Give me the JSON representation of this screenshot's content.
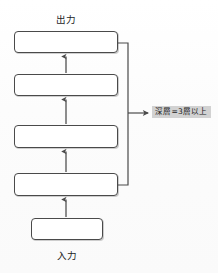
{
  "diagram": {
    "type": "neural-network-layer-stack",
    "background_color": "#fdfdfd",
    "stroke_color": "#4a4a4a",
    "annotation_highlight_color": "#d2d2d2",
    "labels": {
      "output": "出力",
      "input": "入力"
    },
    "annotation": {
      "text": "深層=3層以上",
      "points_to": "layer-stack-bracket"
    },
    "layers": [
      {
        "id": "layer-output",
        "label": "",
        "x": 14,
        "y": 31,
        "width": 104,
        "height": 22
      },
      {
        "id": "layer-hidden-3",
        "label": "",
        "x": 14,
        "y": 74,
        "width": 104,
        "height": 22
      },
      {
        "id": "layer-hidden-2",
        "label": "",
        "x": 14,
        "y": 125,
        "width": 104,
        "height": 23
      },
      {
        "id": "layer-hidden-1",
        "label": "",
        "x": 14,
        "y": 173,
        "width": 104,
        "height": 23
      },
      {
        "id": "layer-input",
        "label": "",
        "x": 31,
        "y": 218,
        "width": 72,
        "height": 22
      }
    ],
    "arrows": [
      {
        "id": "arrow-input-to-hidden1",
        "from": "layer-input",
        "to": "layer-hidden-1",
        "direction": "up"
      },
      {
        "id": "arrow-hidden1-to-hidden2",
        "from": "layer-hidden-1",
        "to": "layer-hidden-2",
        "direction": "up"
      },
      {
        "id": "arrow-hidden2-to-hidden3",
        "from": "layer-hidden-2",
        "to": "layer-hidden-3",
        "direction": "up"
      },
      {
        "id": "arrow-hidden3-to-output",
        "from": "layer-hidden-3",
        "to": "layer-output",
        "direction": "up"
      }
    ],
    "bracket": {
      "id": "depth-bracket",
      "spans_layers": [
        "layer-output",
        "layer-hidden-3",
        "layer-hidden-2",
        "layer-hidden-1"
      ],
      "x": 128,
      "top": 43,
      "bottom": 185,
      "arrow_y": 113
    }
  }
}
